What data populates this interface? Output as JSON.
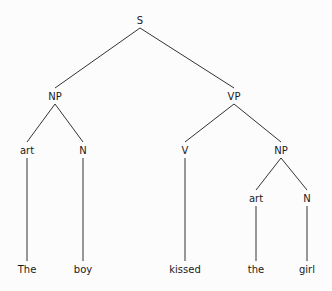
{
  "tree": {
    "title": "Phrase structure tree",
    "sentence": "The boy kissed the girl",
    "line_color": "#333333",
    "nodes": {
      "S": {
        "label": "S",
        "x": 140,
        "y": 20
      },
      "NP1": {
        "label": "NP",
        "x": 55,
        "y": 96
      },
      "VP": {
        "label": "VP",
        "x": 234,
        "y": 96
      },
      "art1": {
        "label": "art",
        "x": 27,
        "y": 150
      },
      "N1": {
        "label": "N",
        "x": 83,
        "y": 150
      },
      "V": {
        "label": "V",
        "x": 185,
        "y": 150
      },
      "NP2": {
        "label": "NP",
        "x": 281,
        "y": 150
      },
      "art2": {
        "label": "art",
        "x": 256,
        "y": 198
      },
      "N2": {
        "label": "N",
        "x": 307,
        "y": 198
      },
      "w1": {
        "label": "The",
        "x": 27,
        "y": 269
      },
      "w2": {
        "label": "boy",
        "x": 83,
        "y": 269
      },
      "w3": {
        "label": "kissed",
        "x": 185,
        "y": 269
      },
      "w4": {
        "label": "the",
        "x": 256,
        "y": 269
      },
      "w5": {
        "label": "girl",
        "x": 307,
        "y": 269
      }
    },
    "edges": [
      [
        "S",
        "NP1"
      ],
      [
        "S",
        "VP"
      ],
      [
        "NP1",
        "art1"
      ],
      [
        "NP1",
        "N1"
      ],
      [
        "VP",
        "V"
      ],
      [
        "VP",
        "NP2"
      ],
      [
        "NP2",
        "art2"
      ],
      [
        "NP2",
        "N2"
      ],
      [
        "art1",
        "w1"
      ],
      [
        "N1",
        "w2"
      ],
      [
        "V",
        "w3"
      ],
      [
        "art2",
        "w4"
      ],
      [
        "N2",
        "w5"
      ]
    ]
  }
}
